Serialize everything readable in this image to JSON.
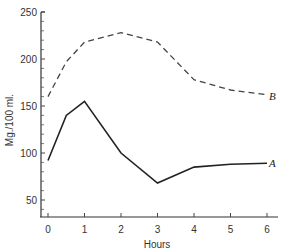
{
  "chart_data": {
    "type": "line",
    "title": "",
    "xlabel": "Hours",
    "ylabel": "Mg./100 ml.",
    "xlim": [
      0,
      6
    ],
    "ylim": [
      30,
      250
    ],
    "x_ticks": [
      0,
      1,
      2,
      3,
      4,
      5,
      6
    ],
    "y_ticks": [
      50,
      100,
      150,
      200,
      250
    ],
    "grid": false,
    "legend": "inline labels at line ends",
    "x": [
      0,
      0.5,
      1,
      2,
      3,
      4,
      5,
      6
    ],
    "series": [
      {
        "name": "A",
        "style": "solid",
        "values": [
          92,
          140,
          155,
          100,
          68,
          85,
          88,
          89
        ]
      },
      {
        "name": "B",
        "style": "dashed",
        "values": [
          160,
          197,
          218,
          228,
          218,
          178,
          167,
          162
        ]
      }
    ]
  },
  "labels": {
    "xlabel": "Hours",
    "ylabel": "Mg./100 ml.",
    "series_a": "A",
    "series_b": "B",
    "xticks": [
      "0",
      "1",
      "2",
      "3",
      "4",
      "5",
      "6"
    ],
    "yticks": [
      "50",
      "100",
      "150",
      "200",
      "250"
    ]
  }
}
